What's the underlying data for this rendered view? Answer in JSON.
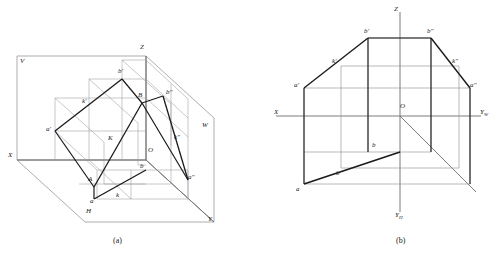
{
  "figure": {
    "colors": {
      "thin_line": "#8a8a8a",
      "thick_line": "#1a1a1a",
      "axis_line": "#6e6e6e",
      "text": "#1a1a1a",
      "background": "#ffffff"
    },
    "captions": [
      {
        "id": "caption-a",
        "text": "(a)"
      },
      {
        "id": "caption-b",
        "text": "(b)"
      }
    ]
  },
  "panel_a": {
    "name": "axonometric-three-plane-view",
    "plane_labels": [
      {
        "id": "plane-v",
        "text": "V"
      },
      {
        "id": "plane-h",
        "text": "H"
      },
      {
        "id": "plane-w",
        "text": "W"
      }
    ],
    "axis_labels": [
      {
        "id": "axis-x",
        "text": "X"
      },
      {
        "id": "axis-y-front",
        "text": "Y"
      },
      {
        "id": "axis-y-right",
        "text": "Y"
      },
      {
        "id": "axis-z",
        "text": "Z"
      },
      {
        "id": "origin",
        "text": "O"
      }
    ],
    "point_labels": [
      {
        "id": "point-A",
        "text": "A"
      },
      {
        "id": "point-B",
        "text": "B"
      },
      {
        "id": "point-K",
        "text": "K"
      },
      {
        "id": "point-a-front",
        "text": "a'"
      },
      {
        "id": "point-b-front",
        "text": "b'"
      },
      {
        "id": "point-k-front",
        "text": "k'"
      },
      {
        "id": "point-a-side",
        "text": "a\""
      },
      {
        "id": "point-b-side",
        "text": "b\""
      },
      {
        "id": "point-k-side",
        "text": "k\""
      },
      {
        "id": "point-a-top",
        "text": "a"
      },
      {
        "id": "point-b-top",
        "text": "b"
      },
      {
        "id": "point-k-top",
        "text": "k"
      }
    ]
  },
  "panel_b": {
    "name": "unfolded-projection-drawing",
    "axis_labels": [
      {
        "id": "axis-x",
        "text": "X"
      },
      {
        "id": "axis-yw",
        "text": "Y",
        "sub": "W"
      },
      {
        "id": "axis-yh",
        "text": "Y",
        "sub": "H"
      },
      {
        "id": "axis-z",
        "text": "Z"
      },
      {
        "id": "origin",
        "text": "O"
      }
    ],
    "point_labels": [
      {
        "id": "point-a-front",
        "text": "a'"
      },
      {
        "id": "point-b-front",
        "text": "b'"
      },
      {
        "id": "point-k-front",
        "text": "k'"
      },
      {
        "id": "point-a-side",
        "text": "a\""
      },
      {
        "id": "point-b-side",
        "text": "b\""
      },
      {
        "id": "point-k-side",
        "text": "k\""
      },
      {
        "id": "point-a-top",
        "text": "a"
      },
      {
        "id": "point-b-top",
        "text": "b"
      },
      {
        "id": "point-k-top",
        "text": "b"
      }
    ]
  }
}
